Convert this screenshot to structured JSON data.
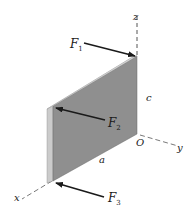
{
  "figure": {
    "type": "3d-statics-diagram",
    "axes": {
      "x_label": "x",
      "y_label": "y",
      "z_label": "z",
      "origin_label": "O"
    },
    "dimensions": {
      "width_label": "a",
      "height_label": "c"
    },
    "forces": [
      {
        "symbol": "F",
        "subscript": "1"
      },
      {
        "symbol": "F",
        "subscript": "2"
      },
      {
        "symbol": "F",
        "subscript": "3"
      }
    ],
    "colors": {
      "plate_face": "#8e8e8e",
      "plate_edge": "#c9c9c9",
      "arrow": "#1a1a1a",
      "axis_dash": "#555555"
    }
  }
}
